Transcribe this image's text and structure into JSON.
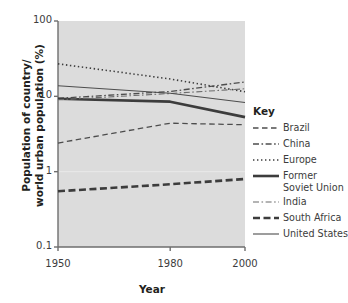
{
  "chart_data": {
    "type": "line",
    "title": "",
    "xlabel": "Year",
    "ylabel": "Population of country/\nworld urban population (%)",
    "xlim": [
      1950,
      2000
    ],
    "ylim": [
      0.1,
      100
    ],
    "yscale": "log",
    "grid": false,
    "legend_position": "right",
    "legend_title": "Key",
    "xticks": [
      "1950",
      "1980",
      "2000"
    ],
    "xtick_values": [
      1950,
      1980,
      2000
    ],
    "yticks": [
      "100",
      "10",
      "1",
      "0.1"
    ],
    "ytick_values": [
      100,
      10,
      1,
      0.1
    ],
    "x": [
      1950,
      1980,
      2000
    ],
    "series": [
      {
        "name": "Brazil",
        "style": "dashed",
        "width": 1.3,
        "color": "#4d4d4d",
        "values": [
          2.4,
          4.4,
          4.2
        ]
      },
      {
        "name": "China",
        "style": "dashdot",
        "width": 1.3,
        "color": "#4d4d4d",
        "values": [
          9.4,
          11.6,
          15.5
        ]
      },
      {
        "name": "Europe",
        "style": "dotted",
        "width": 1.6,
        "color": "#3c3c3c",
        "values": [
          27.0,
          17.0,
          11.5
        ]
      },
      {
        "name": "Former Soviet Union",
        "style": "solid",
        "width": 2.6,
        "color": "#3c3c3c",
        "values": [
          9.3,
          8.5,
          5.3
        ]
      },
      {
        "name": "India",
        "style": "dashdot",
        "width": 1.1,
        "color": "#6b6b6b",
        "values": [
          9.0,
          10.9,
          12.6
        ]
      },
      {
        "name": "South Africa",
        "style": "dashed",
        "width": 2.6,
        "color": "#3c3c3c",
        "values": [
          0.55,
          0.68,
          0.8
        ]
      },
      {
        "name": "United States",
        "style": "solid",
        "width": 1.1,
        "color": "#4d4d4d",
        "values": [
          13.8,
          11.0,
          8.3
        ]
      }
    ]
  },
  "legend": {
    "title": "Key",
    "items": [
      {
        "label": "Brazil"
      },
      {
        "label": "China"
      },
      {
        "label": "Europe"
      },
      {
        "label": "Former\nSoviet Union"
      },
      {
        "label": "India"
      },
      {
        "label": "South Africa"
      },
      {
        "label": "United States"
      }
    ]
  },
  "axes": {
    "x_title": "Year",
    "y_title": "Population of country/\nworld urban population (%)"
  },
  "colors": {
    "plot_background": "#dcdcdc",
    "axis": "#6e6e6e",
    "text": "#231f20"
  }
}
